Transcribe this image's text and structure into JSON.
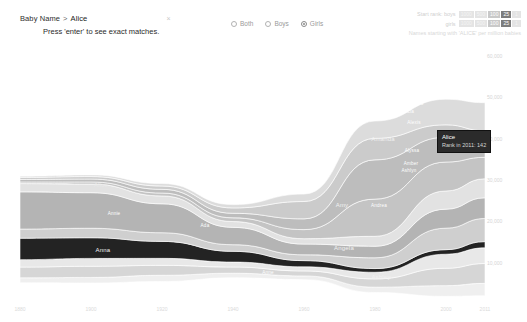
{
  "search": {
    "label": "Baby Name",
    "separator": ">",
    "value": "Alice",
    "clear_glyph": "×",
    "hint": "Press 'enter' to see exact matches."
  },
  "gender_filter": {
    "options": [
      {
        "label": "Both",
        "selected": false
      },
      {
        "label": "Boys",
        "selected": false
      },
      {
        "label": "Girls",
        "selected": true
      }
    ]
  },
  "top_right": {
    "rows": [
      {
        "caption": "Start rank:  boys",
        "segments": [
          {
            "text": "1000",
            "state": "off"
          },
          {
            "text": "500",
            "state": "off"
          },
          {
            "text": "100",
            "state": "mid"
          },
          {
            "text": "25",
            "state": "on"
          },
          {
            "text": "1",
            "state": "off"
          }
        ]
      },
      {
        "caption": "girls",
        "segments": [
          {
            "text": "1000",
            "state": "off"
          },
          {
            "text": "500",
            "state": "off"
          },
          {
            "text": "100",
            "state": "mid"
          },
          {
            "text": "25",
            "state": "on"
          },
          {
            "text": "1",
            "state": "off"
          }
        ]
      }
    ],
    "note": "Names starting with 'ALICE' per million babies"
  },
  "tooltip": {
    "name": "Alice",
    "rank_text": "Rank in 2011: 142"
  },
  "chart_data": {
    "type": "area",
    "title": "Names starting with 'ALICE' per million babies",
    "xlabel": "",
    "ylabel": "",
    "x": [
      1880,
      1900,
      1920,
      1940,
      1960,
      1980,
      2000,
      2011
    ],
    "xticklabels": [
      "1880",
      "1900",
      "1920",
      "1940",
      "1960",
      "1980",
      "2000",
      "2011"
    ],
    "ylim": [
      0,
      60000
    ],
    "yticks": [
      10000,
      20000,
      30000,
      40000,
      50000,
      60000
    ],
    "yticklabels": [
      "10,000",
      "20,000",
      "30,000",
      "40,000",
      "50,000",
      "60,000"
    ],
    "grid": false,
    "legend": "none",
    "highlight": "Alice",
    "stream_labels": [
      {
        "text": "Alice",
        "x": 101,
        "y": 185,
        "style": "onblack"
      },
      {
        "text": "Anna",
        "x": 103,
        "y": 250,
        "style": "dim"
      },
      {
        "text": "Annie",
        "x": 114,
        "y": 213,
        "style": "tiny"
      },
      {
        "text": "Agnes",
        "x": 97,
        "y": 161,
        "style": "tiny"
      },
      {
        "text": "Alma",
        "x": 99,
        "y": 288,
        "style": "tiny"
      },
      {
        "text": "Ada",
        "x": 205,
        "y": 225,
        "style": "tiny"
      },
      {
        "text": "Anne",
        "x": 268,
        "y": 272,
        "style": "tiny"
      },
      {
        "text": "Amanda",
        "x": 383,
        "y": 139,
        "style": "dim"
      },
      {
        "text": "Amy",
        "x": 342,
        "y": 205,
        "style": "dim"
      },
      {
        "text": "Angela",
        "x": 344,
        "y": 248,
        "style": "dim"
      },
      {
        "text": "Ashley",
        "x": 381,
        "y": 277,
        "style": "dim"
      },
      {
        "text": "Andrea",
        "x": 379,
        "y": 205,
        "style": "tiny"
      },
      {
        "text": "Alexandra",
        "x": 412,
        "y": 103,
        "style": "tiny"
      },
      {
        "text": "Alicia",
        "x": 408,
        "y": 111,
        "style": "tiny"
      },
      {
        "text": "Alexis",
        "x": 414,
        "y": 122,
        "style": "tiny"
      },
      {
        "text": "Alyssa",
        "x": 412,
        "y": 150,
        "style": "tiny"
      },
      {
        "text": "Amber",
        "x": 411,
        "y": 163,
        "style": "tiny"
      },
      {
        "text": "Ashlyn",
        "x": 409,
        "y": 170,
        "style": "tiny"
      },
      {
        "text": "Abigail",
        "x": 463,
        "y": 70,
        "style": "tiny"
      },
      {
        "text": "Addison",
        "x": 460,
        "y": 80,
        "style": "tiny"
      },
      {
        "text": "Ava",
        "x": 397,
        "y": 96,
        "style": "tiny"
      }
    ],
    "series": [
      {
        "name": "band-01",
        "color": "#efefef",
        "values": [
          1200,
          1350,
          1500,
          1100,
          900,
          1300,
          2600,
          3000
        ]
      },
      {
        "name": "band-02",
        "color": "#d6d6d6",
        "values": [
          2600,
          2700,
          2400,
          1500,
          1200,
          2000,
          4200,
          4800
        ]
      },
      {
        "name": "band-03",
        "color": "#e8e8e8",
        "values": [
          1800,
          1900,
          1700,
          1200,
          1000,
          1600,
          3400,
          3800
        ]
      },
      {
        "name": "Alice",
        "color": "#232323",
        "values": [
          5200,
          5000,
          4100,
          2600,
          1500,
          900,
          1100,
          1500
        ]
      },
      {
        "name": "band-05",
        "color": "#cfcfcf",
        "values": [
          2200,
          2300,
          2100,
          1600,
          1400,
          2600,
          5200,
          5600
        ]
      },
      {
        "name": "Anna",
        "color": "#b4b4b4",
        "values": [
          9000,
          8600,
          7000,
          4200,
          2600,
          2800,
          4600,
          5000
        ]
      },
      {
        "name": "band-07",
        "color": "#e2e2e2",
        "values": [
          2000,
          2100,
          1900,
          1400,
          1300,
          2400,
          4400,
          4600
        ]
      },
      {
        "name": "Ashley",
        "color": "#c4c4c4",
        "values": [
          400,
          500,
          700,
          900,
          2200,
          9000,
          7000,
          5200
        ]
      },
      {
        "name": "Amanda",
        "color": "#bdbdbd",
        "values": [
          600,
          700,
          900,
          1100,
          2600,
          9500,
          6000,
          4000
        ]
      },
      {
        "name": "Amy",
        "color": "#cbcbcb",
        "values": [
          500,
          600,
          800,
          1300,
          4200,
          5200,
          3000,
          2400
        ]
      },
      {
        "name": "band-11",
        "color": "#dcdcdc",
        "values": [
          300,
          400,
          600,
          800,
          1800,
          4200,
          6200,
          6800
        ]
      }
    ]
  }
}
